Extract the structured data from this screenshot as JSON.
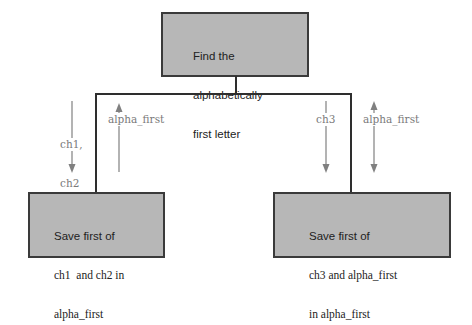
{
  "diagram": {
    "type": "structure-chart",
    "top_box": {
      "lines": [
        "Find the",
        "alphabetically",
        "first letter"
      ]
    },
    "left_box": {
      "lines": [
        "Save first of",
        "ch1  and ch2 in",
        "alpha_first"
      ]
    },
    "right_box": {
      "lines": [
        "Save first of",
        "ch3 and alpha_first",
        "in alpha_first"
      ]
    },
    "left_branch": {
      "down_label_lines": [
        "ch1,",
        "ch2"
      ],
      "up_label": "alpha_first"
    },
    "right_branch": {
      "down_label": "ch3",
      "bidirectional_label": "alpha_first"
    },
    "colors": {
      "box_fill": "#b7b7b7",
      "box_border": "#3a3a3a",
      "connector": "#2e2e2e",
      "arrow": "#808080",
      "label": "#7a7a7a"
    }
  }
}
